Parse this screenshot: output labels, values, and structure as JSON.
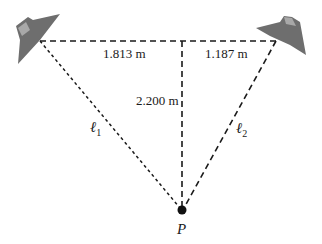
{
  "diagram": {
    "labels": {
      "left_segment": "1.813 m",
      "right_segment": "1.187 m",
      "vertical_distance": "2.200 m",
      "path_1": "ℓ",
      "path_1_sub": "1",
      "path_2": "ℓ",
      "path_2_sub": "2",
      "point": "P"
    },
    "values": {
      "left_horizontal_m": 1.813,
      "right_horizontal_m": 1.187,
      "vertical_m": 2.2
    },
    "elements": [
      {
        "id": "speaker-left",
        "type": "speaker",
        "position": "top-left"
      },
      {
        "id": "speaker-right",
        "type": "speaker",
        "position": "top-right"
      },
      {
        "id": "point-P",
        "type": "point",
        "position": "bottom-center"
      }
    ],
    "colors": {
      "line": "#1a1a1a",
      "speaker": "#6e6e6e",
      "speaker_light": "#a0a0a0"
    }
  }
}
